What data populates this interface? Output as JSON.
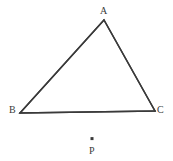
{
  "figure": {
    "background_color": "#ffffff",
    "stroke_color": "#3a3a3a",
    "label_color": "#3a3a3a",
    "stroke_width": 1.5,
    "width": 173,
    "height": 161
  },
  "labels": {
    "a": "A",
    "b": "B",
    "c": "C",
    "p": "P"
  },
  "points": {
    "A": {
      "x": 104,
      "y": 20
    },
    "B": {
      "x": 20,
      "y": 113
    },
    "C": {
      "x": 155,
      "y": 111
    },
    "P": {
      "x": 92,
      "y": 139
    }
  },
  "chart_data": {
    "type": "scatter",
    "xlabel": "",
    "ylabel": "",
    "xlim": [
      0,
      173
    ],
    "ylim": [
      0,
      161
    ],
    "grid": false,
    "legend": "none",
    "series": [
      {
        "name": "Triangle ABC",
        "kind": "polygon",
        "closed": true,
        "labels": [
          "A",
          "B",
          "C"
        ],
        "x": [
          104,
          20,
          155
        ],
        "y": [
          20,
          113,
          111
        ]
      },
      {
        "name": "Point P",
        "kind": "point",
        "labels": [
          "P"
        ],
        "x": [
          92
        ],
        "y": [
          139
        ]
      }
    ],
    "annotations": [
      {
        "text": "A",
        "x": 104,
        "y": 11,
        "anchor": "middle"
      },
      {
        "text": "B",
        "x": 13,
        "y": 110,
        "anchor": "middle"
      },
      {
        "text": "C",
        "x": 161,
        "y": 110,
        "anchor": "middle"
      },
      {
        "text": "P",
        "x": 93,
        "y": 151,
        "anchor": "middle"
      }
    ]
  }
}
